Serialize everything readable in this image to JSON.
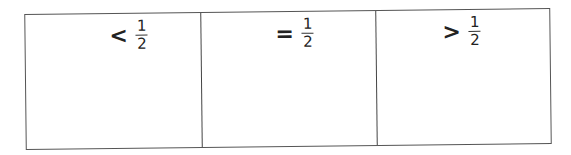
{
  "table": {
    "columns": [
      {
        "symbol": "<",
        "numerator": "1",
        "denominator": "2"
      },
      {
        "symbol": "=",
        "numerator": "1",
        "denominator": "2"
      },
      {
        "symbol": ">",
        "numerator": "1",
        "denominator": "2"
      }
    ]
  }
}
